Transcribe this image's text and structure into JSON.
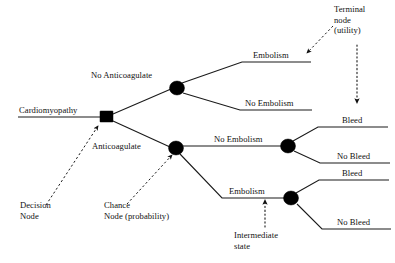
{
  "diagram": {
    "type": "decision-tree",
    "colors": {
      "line": "#1a1a1a",
      "node_fill": "#000000",
      "background": "#ffffff",
      "text": "#111111"
    },
    "root_label": "Cardiomyopathy",
    "decision_branches": [
      {
        "id": "no-anticoagulate",
        "label": "No Anticoagulate"
      },
      {
        "id": "anticoagulate",
        "label": "Anticoagulate"
      }
    ],
    "outcome_labels": {
      "embolism_top": "Embolism",
      "no_embolism_top": "No Embolism",
      "no_embolism_mid": "No Embolism",
      "embolism_low": "Embolism",
      "bleed_upper": "Bleed",
      "no_bleed_upper": "No Bleed",
      "bleed_lower": "Bleed",
      "no_bleed_lower": "No Bleed"
    },
    "annotations": [
      {
        "id": "decision-node",
        "label": "Decision\nNode",
        "lines": [
          "Decision",
          "Node"
        ]
      },
      {
        "id": "chance-node",
        "label": "Chance\nNode (probability)",
        "lines": [
          "Chance",
          "Node (probability)"
        ]
      },
      {
        "id": "terminal-node",
        "label": "Terminal\nnode\n(utility)",
        "lines": [
          "Terminal",
          "node",
          "(utility)"
        ]
      },
      {
        "id": "intermediate-state",
        "label": "Intermediate\nstate",
        "lines": [
          "Intermediate",
          "state"
        ]
      }
    ],
    "nodes": [
      {
        "id": "decision-node-square",
        "shape": "square",
        "x": 106,
        "y": 117
      },
      {
        "id": "chance-node-upper",
        "shape": "circle",
        "x": 177,
        "y": 88
      },
      {
        "id": "chance-node-lower",
        "shape": "circle",
        "x": 176,
        "y": 148
      },
      {
        "id": "chance-node-right-upper",
        "shape": "circle",
        "x": 288,
        "y": 146
      },
      {
        "id": "chance-node-right-lower",
        "shape": "circle",
        "x": 291,
        "y": 198
      }
    ]
  }
}
